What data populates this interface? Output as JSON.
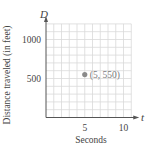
{
  "chart_data": {
    "type": "scatter",
    "title": "",
    "xlabel": "Seconds",
    "ylabel": "Distance traveled (in feet)",
    "x_axis_var": "t",
    "y_axis_var": "D",
    "xlim": [
      0,
      11
    ],
    "ylim": [
      0,
      1200
    ],
    "x_ticks": [
      5,
      10
    ],
    "x_tick_labels": [
      "5",
      "10"
    ],
    "y_ticks": [
      500,
      1000
    ],
    "y_tick_labels": [
      "500",
      "1000"
    ],
    "grid": true,
    "grid_step_x": 1,
    "grid_step_y": 100,
    "legend": null,
    "series": [
      {
        "name": "point",
        "points": [
          {
            "x": 5,
            "y": 550
          }
        ]
      }
    ],
    "annotations": [
      {
        "x": 5,
        "y": 550,
        "text": "(5, 550)"
      }
    ],
    "colors": {
      "point": "#8a8a8a",
      "grid": "#d9d9d9",
      "axis": "#555555",
      "text": "#444444"
    }
  }
}
